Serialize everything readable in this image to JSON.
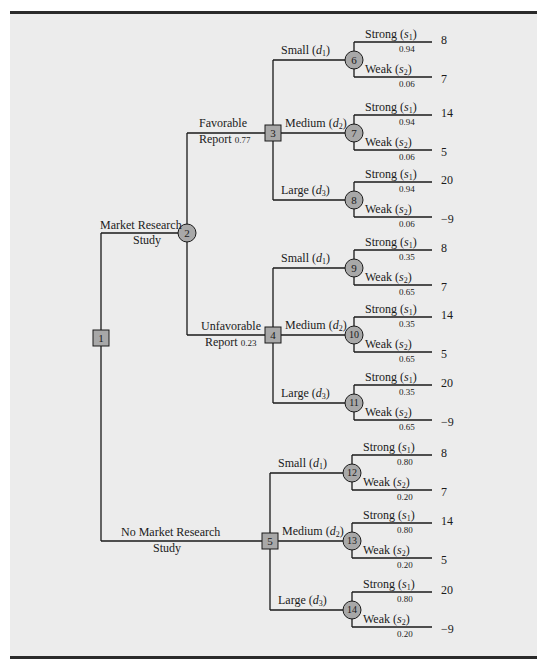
{
  "figure": {
    "background": "#ececec",
    "line_color": "#1a1a1a",
    "node_fill": "#a8a8a8"
  },
  "nodes": [
    {
      "id": "1",
      "type": "decision",
      "x": 101,
      "y": 338
    },
    {
      "id": "2",
      "type": "chance",
      "x": 187,
      "y": 233
    },
    {
      "id": "3",
      "type": "decision",
      "x": 273,
      "y": 133
    },
    {
      "id": "4",
      "type": "decision",
      "x": 273,
      "y": 335
    },
    {
      "id": "5",
      "type": "decision",
      "x": 270,
      "y": 541
    },
    {
      "id": "6",
      "type": "chance",
      "x": 354,
      "y": 60
    },
    {
      "id": "7",
      "type": "chance",
      "x": 354,
      "y": 133
    },
    {
      "id": "8",
      "type": "chance",
      "x": 354,
      "y": 200
    },
    {
      "id": "9",
      "type": "chance",
      "x": 354,
      "y": 268
    },
    {
      "id": "10",
      "type": "chance",
      "x": 354,
      "y": 335
    },
    {
      "id": "11",
      "type": "chance",
      "x": 354,
      "y": 403
    },
    {
      "id": "12",
      "type": "chance",
      "x": 352,
      "y": 473
    },
    {
      "id": "13",
      "type": "chance",
      "x": 352,
      "y": 541
    },
    {
      "id": "14",
      "type": "chance",
      "x": 352,
      "y": 610
    }
  ],
  "branches": {
    "market_research": {
      "line1": "Market Research",
      "line2": "Study"
    },
    "no_market_research": {
      "line1": "No Market Research",
      "line2": "Study"
    },
    "favorable": {
      "line1": "Favorable",
      "line2": "Report",
      "prob": "0.77"
    },
    "unfavorable": {
      "line1": "Unfavorable",
      "line2": "Report",
      "prob": "0.23"
    }
  },
  "decisions": [
    {
      "label": "Small",
      "var": "d",
      "sub": "1"
    },
    {
      "label": "Medium",
      "var": "d",
      "sub": "2"
    },
    {
      "label": "Large",
      "var": "d",
      "sub": "3"
    }
  ],
  "states": {
    "strong": {
      "label": "Strong",
      "var": "s",
      "sub": "1"
    },
    "weak": {
      "label": "Weak",
      "var": "s",
      "sub": "2"
    }
  },
  "groups": [
    {
      "name": "favorable",
      "chance_nodes": [
        {
          "node": "6",
          "decision": "Small",
          "p_strong": "0.94",
          "p_weak": "0.06",
          "payoff_strong": "8",
          "payoff_weak": "7"
        },
        {
          "node": "7",
          "decision": "Medium",
          "p_strong": "0.94",
          "p_weak": "0.06",
          "payoff_strong": "14",
          "payoff_weak": "5"
        },
        {
          "node": "8",
          "decision": "Large",
          "p_strong": "0.94",
          "p_weak": "0.06",
          "payoff_strong": "20",
          "payoff_weak": "−9"
        }
      ]
    },
    {
      "name": "unfavorable",
      "chance_nodes": [
        {
          "node": "9",
          "decision": "Small",
          "p_strong": "0.35",
          "p_weak": "0.65",
          "payoff_strong": "8",
          "payoff_weak": "7"
        },
        {
          "node": "10",
          "decision": "Medium",
          "p_strong": "0.35",
          "p_weak": "0.65",
          "payoff_strong": "14",
          "payoff_weak": "5"
        },
        {
          "node": "11",
          "decision": "Large",
          "p_strong": "0.35",
          "p_weak": "0.65",
          "payoff_strong": "20",
          "payoff_weak": "−9"
        }
      ]
    },
    {
      "name": "no_market_research",
      "chance_nodes": [
        {
          "node": "12",
          "decision": "Small",
          "p_strong": "0.80",
          "p_weak": "0.20",
          "payoff_strong": "8",
          "payoff_weak": "7"
        },
        {
          "node": "13",
          "decision": "Medium",
          "p_strong": "0.80",
          "p_weak": "0.20",
          "payoff_strong": "14",
          "payoff_weak": "5"
        },
        {
          "node": "14",
          "decision": "Large",
          "p_strong": "0.80",
          "p_weak": "0.20",
          "payoff_strong": "20",
          "payoff_weak": "−9"
        }
      ]
    }
  ]
}
